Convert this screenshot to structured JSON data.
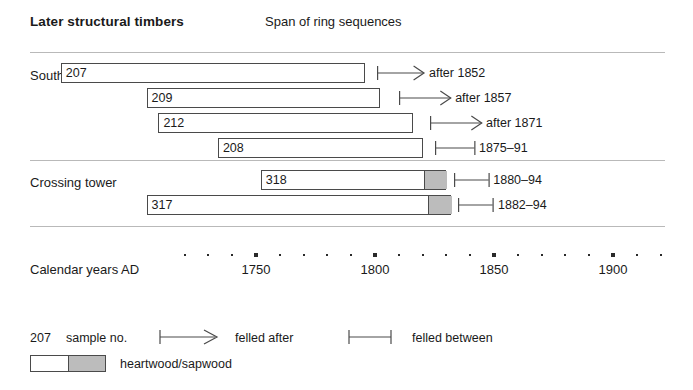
{
  "header": {
    "title": "Later structural timbers",
    "subtitle": "Span of ring sequences"
  },
  "groups": [
    {
      "label": "South transept"
    },
    {
      "label": "Crossing tower"
    }
  ],
  "axis": {
    "caption": "Calendar years AD",
    "tick_labels": [
      "1750",
      "1800",
      "1850",
      "1900"
    ],
    "major_years": [
      1750,
      1800,
      1850,
      1900
    ],
    "minor_step": 10,
    "range": [
      1700,
      1925
    ]
  },
  "legend": {
    "sample_no_example": "207",
    "sample_no_label": "sample no.",
    "felled_after_label": "felled after",
    "felled_between_label": "felled between",
    "heartwood_sapwood_label": "heartwood/sapwood",
    "arrow_icon": "felled-after-arrow-icon",
    "bracket_icon": "felled-between-bracket-icon",
    "swatch_icon": "heartwood-sapwood-swatch-icon"
  },
  "colors": {
    "heartwood": "#ffffff",
    "sapwood": "#bcbcbc",
    "outline": "#4a4a4a",
    "rule": "#b9b9b9",
    "text": "#1a1a1a"
  },
  "chart_data": {
    "type": "bar",
    "title": "Later structural timbers",
    "subtitle": "Span of ring sequences",
    "xlabel": "Calendar years AD",
    "ylabel": "",
    "xlim": [
      1700,
      1925
    ],
    "grid": false,
    "legend": "bottom",
    "orientation": "horizontal",
    "note": "Dendrochronology ring-sequence span chart; each bar is one timber sample's measured ring span, with optional sapwood (grey) at the outer end, plus a felling-date marker.",
    "series": [
      {
        "group": "South transept",
        "samples": [
          {
            "sample_no": "207",
            "start_year": 1668,
            "end_year": 1796,
            "heartwood_end_year": 1796,
            "sapwood_start_year": null,
            "sapwood_end_year": null,
            "marker_type": "after",
            "marker_label": "after 1852",
            "marker_start_year": 1801,
            "marker_end_year": 1821
          },
          {
            "sample_no": "209",
            "start_year": 1704,
            "end_year": 1802,
            "heartwood_end_year": 1802,
            "sapwood_start_year": null,
            "sapwood_end_year": null,
            "marker_type": "after",
            "marker_label": "after 1857",
            "marker_start_year": 1810,
            "marker_end_year": 1832
          },
          {
            "sample_no": "212",
            "start_year": 1709,
            "end_year": 1816,
            "heartwood_end_year": 1816,
            "sapwood_start_year": null,
            "sapwood_end_year": null,
            "marker_type": "after",
            "marker_label": "after 1871",
            "marker_start_year": 1823,
            "marker_end_year": 1845
          },
          {
            "sample_no": "208",
            "start_year": 1734,
            "end_year": 1820,
            "heartwood_end_year": 1820,
            "sapwood_start_year": null,
            "sapwood_end_year": null,
            "marker_type": "between",
            "marker_label": "1875–91",
            "marker_start_year": 1825,
            "marker_end_year": 1842
          }
        ]
      },
      {
        "group": "Crossing tower",
        "samples": [
          {
            "sample_no": "318",
            "start_year": 1752,
            "end_year": 1830,
            "heartwood_end_year": 1820,
            "sapwood_start_year": 1820,
            "sapwood_end_year": 1830,
            "marker_type": "between",
            "marker_label": "1880–94",
            "marker_start_year": 1833,
            "marker_end_year": 1848
          },
          {
            "sample_no": "317",
            "start_year": 1704,
            "end_year": 1832,
            "heartwood_end_year": 1822,
            "sapwood_start_year": 1822,
            "sapwood_end_year": 1832,
            "marker_type": "between",
            "marker_label": "1882–94",
            "marker_start_year": 1835,
            "marker_end_year": 1850
          }
        ]
      }
    ]
  }
}
